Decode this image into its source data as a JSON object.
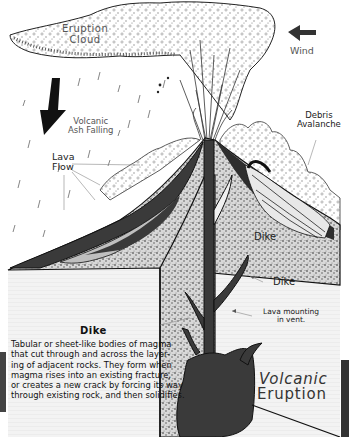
{
  "diagram": {
    "title": "Volcanic Eruption",
    "title_lines": [
      "Volcanic",
      "Eruption"
    ],
    "labels": {
      "eruption_cloud": [
        "Eruption",
        "Cloud"
      ],
      "wind": "Wind",
      "volcanic_ash": [
        "Volcanic",
        "Ash Falling"
      ],
      "lava_flow": [
        "Lava",
        "Flow"
      ],
      "debris_avalanche": [
        "Debris",
        "Avalanche"
      ],
      "dike_upper": "Dike",
      "dike_lower": "Dike",
      "lava_vent": [
        "Lava mounting",
        "in vent."
      ]
    },
    "dike_description": {
      "title": "Dike",
      "lines": [
        "Tabular or sheet-like bodies of magma",
        "that cut through and across the layer-",
        "ing of adjacent rocks. They form when",
        "magma rises into an existing fracture,",
        "or creates a new crack by forcing its way",
        "through existing rock, and then solidifies."
      ]
    },
    "icons": {
      "wind_arrow": "arrow-left",
      "ash_arrow": "arrow-down"
    },
    "colors": {
      "magma": "#3a3a3a",
      "rock_stipple": "#9a9a9a",
      "crust_bg": "#f2f2f2",
      "outline": "#111111",
      "label_text": "#222222"
    }
  }
}
